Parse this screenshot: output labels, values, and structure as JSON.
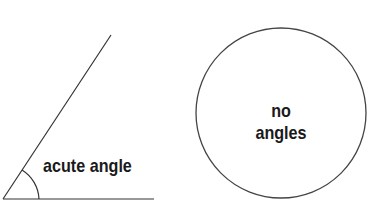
{
  "diagram": {
    "left_figure": {
      "label": "acute angle",
      "shape": "acute-angle"
    },
    "right_figure": {
      "label_line1": "no",
      "label_line2": "angles",
      "shape": "circle"
    },
    "colors": {
      "line": "#333333",
      "text": "#1a1a1a",
      "background": "#ffffff"
    }
  }
}
